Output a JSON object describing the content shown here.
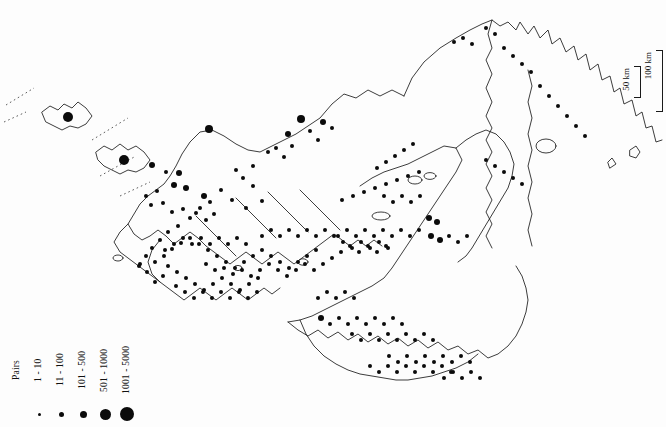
{
  "figure": {
    "type": "distribution-map",
    "edge_caption": "Karte von Kolonien"
  },
  "legend": {
    "title": "Pairs",
    "classes": [
      {
        "label": "1 - 10",
        "dot_px": 3
      },
      {
        "label": "11 - 100",
        "dot_px": 5
      },
      {
        "label": "101 - 500",
        "dot_px": 7
      },
      {
        "label": "501 - 1000",
        "dot_px": 11
      },
      {
        "label": "1001 - 5000",
        "dot_px": 14
      }
    ]
  },
  "scale_bar": {
    "minor_label": "50 km",
    "major_label": "100 km"
  },
  "colors": {
    "background": "#fdfdfd",
    "coastline": "#1a1a1a",
    "symbol": "#0b0b0b",
    "caption": "#8d8d8d"
  },
  "chart_data": {
    "type": "scatter",
    "title": "",
    "xlabel": "",
    "ylabel": "",
    "symbol_classes": [
      "1 - 10",
      "11 - 100",
      "101 - 500",
      "501 - 1000",
      "1001 - 5000"
    ],
    "symbol_radii_px": [
      1.5,
      2.5,
      3.5,
      5.5,
      7
    ],
    "points": [
      [
        68,
        117,
        5
      ],
      [
        124,
        160,
        5
      ],
      [
        209,
        129,
        4
      ],
      [
        301,
        119,
        4
      ],
      [
        323,
        122,
        3
      ],
      [
        152,
        165,
        3
      ],
      [
        166,
        172,
        2
      ],
      [
        179,
        173,
        3
      ],
      [
        174,
        185,
        3
      ],
      [
        186,
        188,
        3
      ],
      [
        204,
        196,
        3
      ],
      [
        157,
        191,
        2
      ],
      [
        146,
        196,
        2
      ],
      [
        151,
        205,
        2
      ],
      [
        163,
        203,
        2
      ],
      [
        172,
        212,
        2
      ],
      [
        183,
        209,
        2
      ],
      [
        196,
        213,
        2
      ],
      [
        206,
        220,
        2
      ],
      [
        214,
        214,
        2
      ],
      [
        232,
        200,
        2
      ],
      [
        246,
        208,
        2
      ],
      [
        262,
        201,
        2
      ],
      [
        253,
        186,
        2
      ],
      [
        243,
        178,
        2
      ],
      [
        268,
        152,
        2
      ],
      [
        276,
        148,
        2
      ],
      [
        284,
        157,
        2
      ],
      [
        292,
        146,
        2
      ],
      [
        288,
        134,
        3
      ],
      [
        310,
        131,
        2
      ],
      [
        318,
        140,
        2
      ],
      [
        332,
        128,
        2
      ],
      [
        253,
        166,
        2
      ],
      [
        236,
        170,
        2
      ],
      [
        221,
        190,
        2
      ],
      [
        210,
        202,
        2
      ],
      [
        200,
        208,
        2
      ],
      [
        190,
        218,
        2
      ],
      [
        178,
        226,
        2
      ],
      [
        168,
        232,
        2
      ],
      [
        160,
        240,
        2
      ],
      [
        152,
        248,
        2
      ],
      [
        146,
        256,
        2
      ],
      [
        140,
        264,
        2
      ],
      [
        155,
        262,
        2
      ],
      [
        164,
        256,
        2
      ],
      [
        172,
        249,
        2
      ],
      [
        181,
        243,
        2
      ],
      [
        190,
        238,
        2
      ],
      [
        199,
        244,
        2
      ],
      [
        208,
        250,
        2
      ],
      [
        217,
        256,
        2
      ],
      [
        226,
        262,
        2
      ],
      [
        235,
        268,
        2
      ],
      [
        244,
        262,
        2
      ],
      [
        253,
        256,
        2
      ],
      [
        262,
        250,
        2
      ],
      [
        271,
        256,
        2
      ],
      [
        280,
        262,
        2
      ],
      [
        289,
        268,
        2
      ],
      [
        298,
        262,
        2
      ],
      [
        307,
        256,
        2
      ],
      [
        316,
        250,
        2
      ],
      [
        168,
        266,
        2
      ],
      [
        177,
        272,
        2
      ],
      [
        186,
        278,
        2
      ],
      [
        195,
        284,
        2
      ],
      [
        204,
        290,
        2
      ],
      [
        213,
        284,
        2
      ],
      [
        222,
        278,
        2
      ],
      [
        231,
        284,
        2
      ],
      [
        240,
        290,
        2
      ],
      [
        249,
        284,
        2
      ],
      [
        258,
        278,
        2
      ],
      [
        176,
        286,
        2
      ],
      [
        185,
        292,
        2
      ],
      [
        194,
        298,
        2
      ],
      [
        203,
        292,
        2
      ],
      [
        212,
        298,
        2
      ],
      [
        221,
        292,
        2
      ],
      [
        230,
        298,
        2
      ],
      [
        239,
        292,
        2
      ],
      [
        248,
        298,
        2
      ],
      [
        257,
        292,
        2
      ],
      [
        163,
        276,
        2
      ],
      [
        155,
        282,
        2
      ],
      [
        147,
        272,
        2
      ],
      [
        139,
        266,
        2
      ],
      [
        206,
        264,
        2
      ],
      [
        215,
        270,
        2
      ],
      [
        224,
        268,
        2
      ],
      [
        233,
        274,
        2
      ],
      [
        242,
        270,
        2
      ],
      [
        251,
        276,
        2
      ],
      [
        260,
        270,
        2
      ],
      [
        269,
        264,
        2
      ],
      [
        278,
        270,
        2
      ],
      [
        287,
        276,
        2
      ],
      [
        296,
        270,
        2
      ],
      [
        305,
        264,
        2
      ],
      [
        314,
        270,
        2
      ],
      [
        323,
        264,
        2
      ],
      [
        332,
        258,
        2
      ],
      [
        341,
        252,
        2
      ],
      [
        350,
        246,
        2
      ],
      [
        359,
        252,
        2
      ],
      [
        368,
        246,
        2
      ],
      [
        377,
        252,
        2
      ],
      [
        386,
        246,
        2
      ],
      [
        262,
        236,
        2
      ],
      [
        271,
        230,
        2
      ],
      [
        280,
        236,
        2
      ],
      [
        289,
        230,
        2
      ],
      [
        298,
        236,
        2
      ],
      [
        307,
        230,
        2
      ],
      [
        316,
        236,
        2
      ],
      [
        325,
        230,
        2
      ],
      [
        334,
        236,
        2
      ],
      [
        343,
        242,
        2
      ],
      [
        352,
        248,
        2
      ],
      [
        361,
        242,
        2
      ],
      [
        370,
        248,
        2
      ],
      [
        379,
        242,
        2
      ],
      [
        388,
        248,
        2
      ],
      [
        246,
        244,
        2
      ],
      [
        237,
        238,
        2
      ],
      [
        228,
        244,
        2
      ],
      [
        219,
        238,
        2
      ],
      [
        210,
        244,
        2
      ],
      [
        201,
        238,
        2
      ],
      [
        192,
        244,
        2
      ],
      [
        183,
        238,
        2
      ],
      [
        174,
        244,
        2
      ],
      [
        165,
        250,
        2
      ],
      [
        338,
        236,
        2
      ],
      [
        347,
        230,
        2
      ],
      [
        356,
        236,
        2
      ],
      [
        365,
        230,
        2
      ],
      [
        374,
        236,
        2
      ],
      [
        383,
        230,
        2
      ],
      [
        392,
        236,
        2
      ],
      [
        401,
        230,
        2
      ],
      [
        410,
        236,
        2
      ],
      [
        419,
        230,
        2
      ],
      [
        384,
        196,
        2
      ],
      [
        393,
        202,
        2
      ],
      [
        402,
        196,
        2
      ],
      [
        411,
        202,
        2
      ],
      [
        420,
        196,
        2
      ],
      [
        429,
        218,
        3
      ],
      [
        437,
        222,
        3
      ],
      [
        419,
        172,
        2
      ],
      [
        408,
        176,
        2
      ],
      [
        397,
        180,
        2
      ],
      [
        386,
        184,
        2
      ],
      [
        375,
        188,
        2
      ],
      [
        364,
        192,
        2
      ],
      [
        353,
        196,
        2
      ],
      [
        342,
        200,
        2
      ],
      [
        431,
        236,
        3
      ],
      [
        440,
        240,
        3
      ],
      [
        449,
        236,
        2
      ],
      [
        458,
        242,
        2
      ],
      [
        467,
        236,
        2
      ],
      [
        321,
        318,
        3
      ],
      [
        330,
        324,
        2
      ],
      [
        339,
        318,
        2
      ],
      [
        348,
        324,
        2
      ],
      [
        357,
        318,
        2
      ],
      [
        366,
        324,
        2
      ],
      [
        375,
        318,
        2
      ],
      [
        384,
        324,
        2
      ],
      [
        393,
        318,
        2
      ],
      [
        402,
        324,
        2
      ],
      [
        352,
        334,
        2
      ],
      [
        361,
        340,
        2
      ],
      [
        370,
        334,
        2
      ],
      [
        379,
        340,
        2
      ],
      [
        388,
        334,
        2
      ],
      [
        397,
        340,
        2
      ],
      [
        406,
        334,
        2
      ],
      [
        415,
        340,
        2
      ],
      [
        424,
        334,
        2
      ],
      [
        433,
        340,
        2
      ],
      [
        370,
        366,
        2
      ],
      [
        379,
        372,
        2
      ],
      [
        388,
        366,
        2
      ],
      [
        397,
        372,
        2
      ],
      [
        406,
        366,
        2
      ],
      [
        415,
        372,
        2
      ],
      [
        424,
        366,
        2
      ],
      [
        433,
        372,
        2
      ],
      [
        442,
        366,
        2
      ],
      [
        451,
        372,
        2
      ],
      [
        389,
        356,
        2
      ],
      [
        398,
        362,
        2
      ],
      [
        407,
        356,
        2
      ],
      [
        416,
        362,
        2
      ],
      [
        425,
        356,
        2
      ],
      [
        434,
        362,
        2
      ],
      [
        443,
        356,
        2
      ],
      [
        452,
        362,
        2
      ],
      [
        461,
        356,
        2
      ],
      [
        470,
        362,
        2
      ],
      [
        480,
        378,
        2
      ],
      [
        471,
        372,
        2
      ],
      [
        462,
        378,
        2
      ],
      [
        453,
        372,
        2
      ],
      [
        444,
        378,
        2
      ],
      [
        454,
        42,
        2
      ],
      [
        463,
        38,
        2
      ],
      [
        472,
        44,
        2
      ],
      [
        486,
        28,
        2
      ],
      [
        495,
        34,
        2
      ],
      [
        504,
        48,
        2
      ],
      [
        513,
        56,
        2
      ],
      [
        522,
        64,
        2
      ],
      [
        531,
        72,
        2
      ],
      [
        540,
        86,
        2
      ],
      [
        549,
        96,
        2
      ],
      [
        558,
        106,
        2
      ],
      [
        567,
        116,
        2
      ],
      [
        576,
        126,
        2
      ],
      [
        585,
        136,
        2
      ],
      [
        486,
        160,
        2
      ],
      [
        495,
        166,
        2
      ],
      [
        504,
        172,
        2
      ],
      [
        513,
        178,
        2
      ],
      [
        522,
        184,
        2
      ],
      [
        413,
        144,
        2
      ],
      [
        404,
        150,
        2
      ],
      [
        395,
        156,
        2
      ],
      [
        386,
        162,
        2
      ],
      [
        377,
        168,
        2
      ],
      [
        318,
        298,
        2
      ],
      [
        327,
        292,
        2
      ],
      [
        336,
        298,
        2
      ],
      [
        345,
        292,
        2
      ],
      [
        354,
        298,
        2
      ]
    ]
  }
}
